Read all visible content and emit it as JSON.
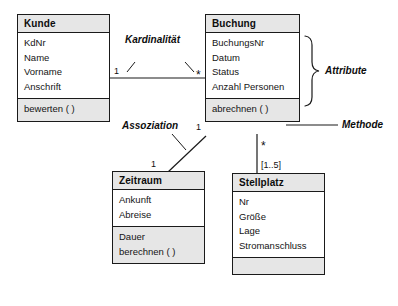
{
  "diagram": {
    "background": "#ffffff",
    "line_color": "#1a1a1a",
    "header_fill": "#e6e6e6"
  },
  "classes": {
    "kunde": {
      "name": "Kunde",
      "attributes": [
        "KdNr",
        "Name",
        "Vorname",
        "Anschrift"
      ],
      "operations": [
        "bewerten ( )"
      ]
    },
    "buchung": {
      "name": "Buchung",
      "attributes": [
        "BuchungsNr",
        "Datum",
        "Status",
        "Anzahl Personen"
      ],
      "operations": [
        "abrechnen ( )"
      ]
    },
    "zeitraum": {
      "name": "Zeitraum",
      "attributes": [
        "Ankunft",
        "Abreise"
      ],
      "operations": [
        "Dauer",
        "berechnen ( )"
      ]
    },
    "stellplatz": {
      "name": "Stellplatz",
      "attributes": [
        "Nr",
        "Größe",
        "Lage",
        "Stromanschluss"
      ],
      "operations": []
    }
  },
  "multiplicities": {
    "kunde_buchung_left": "1",
    "kunde_buchung_right": "*",
    "buchung_zeitraum_top": "1",
    "buchung_zeitraum_bottom": "1",
    "buchung_stellplatz_top": "*",
    "buchung_stellplatz_bottom": "[1..5]"
  },
  "annotations": {
    "kardinalitaet": "Kardinalität",
    "assoziation": "Assoziation",
    "attribute": "Attribute",
    "methode": "Methode"
  }
}
